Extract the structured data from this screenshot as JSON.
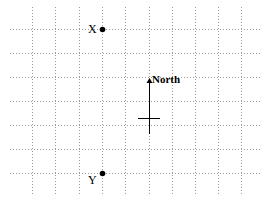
{
  "diagram": {
    "grid": {
      "vertical_x": [
        32,
        55,
        79,
        102,
        125,
        149,
        172,
        195,
        218,
        241
      ],
      "horizontal_y": [
        29,
        53,
        77,
        101,
        125,
        149,
        173
      ],
      "x_extent": [
        10,
        262
      ],
      "y_extent": [
        7,
        195
      ],
      "line_color": "#9a9a9a"
    },
    "points": [
      {
        "id": "X",
        "label": "X",
        "x": 102,
        "y": 29,
        "label_x": 88,
        "label_y": 33
      },
      {
        "id": "Y",
        "label": "Y",
        "x": 102,
        "y": 173,
        "label_x": 88,
        "label_y": 184
      }
    ],
    "north_arrow": {
      "label": "North",
      "x": 149,
      "y_top": 78,
      "y_bottom": 134,
      "crossbar_y": 118,
      "crossbar_x1": 138,
      "crossbar_x2": 160,
      "label_x": 152,
      "label_y": 83
    }
  }
}
